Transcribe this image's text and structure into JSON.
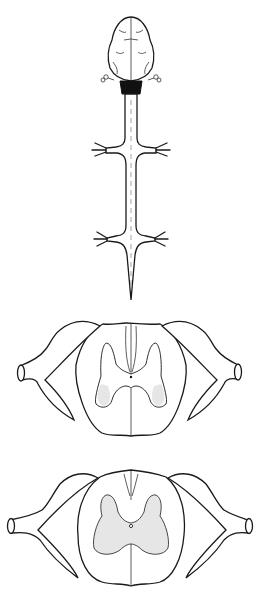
{
  "figure": {
    "title": "",
    "panels": [
      {
        "id": "brain-spinal-cord",
        "description": "Dorsal view of brain and spinal cord with cervical and lumbar enlargements and spinal nerve roots"
      },
      {
        "id": "cervical-cross-section",
        "description": "Transverse section of spinal cord at cervical enlargement with dorsal root ganglia"
      },
      {
        "id": "lumbar-cross-section",
        "description": "Transverse section of spinal cord at lumbar enlargement with dorsal root ganglia"
      }
    ],
    "colors": {
      "line": "#1a1a1a",
      "gray_matter_shading": "#e6e6e6",
      "background": "#ffffff",
      "brainstem_fill": "#111111"
    }
  }
}
